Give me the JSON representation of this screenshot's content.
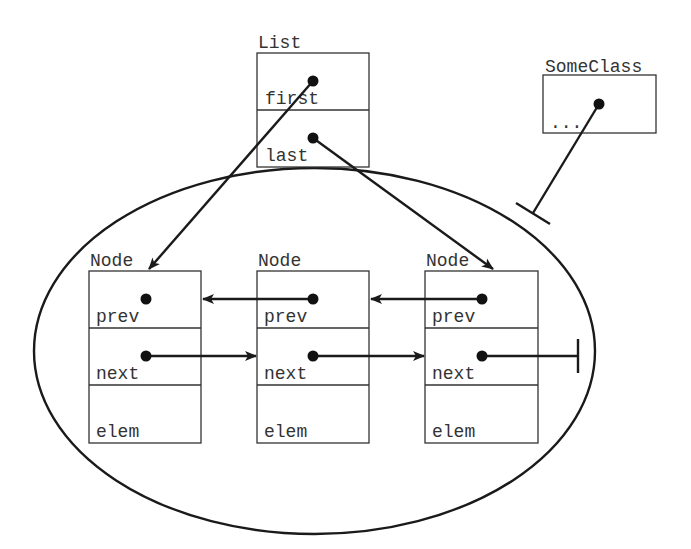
{
  "diagram": {
    "colors": {
      "stroke": "#1a1a1a",
      "text": "#333333",
      "background": "#ffffff"
    },
    "list": {
      "label": "List",
      "fields": [
        "first",
        "last"
      ]
    },
    "some_class": {
      "label": "SomeClass",
      "fields": [
        "..."
      ]
    },
    "nodes": [
      {
        "label": "Node",
        "fields": [
          "prev",
          "next",
          "elem"
        ]
      },
      {
        "label": "Node",
        "fields": [
          "prev",
          "next",
          "elem"
        ]
      },
      {
        "label": "Node",
        "fields": [
          "prev",
          "next",
          "elem"
        ]
      }
    ],
    "edges": [
      {
        "from": "List.first",
        "to": "Node[0]",
        "type": "arrow"
      },
      {
        "from": "List.last",
        "to": "Node[2]",
        "type": "arrow"
      },
      {
        "from": "Node[0].next",
        "to": "Node[1]",
        "type": "arrow"
      },
      {
        "from": "Node[1].next",
        "to": "Node[2]",
        "type": "arrow"
      },
      {
        "from": "Node[1].prev",
        "to": "Node[0]",
        "type": "arrow"
      },
      {
        "from": "Node[2].prev",
        "to": "Node[1]",
        "type": "arrow"
      },
      {
        "from": "Node[0].prev",
        "to": null,
        "type": "none"
      },
      {
        "from": "Node[2].next",
        "to": null,
        "type": "null-terminator"
      },
      {
        "from": "SomeClass.field",
        "to": "List-encapsulation-boundary",
        "type": "blocked-reference"
      }
    ],
    "encapsulation_boundary": "ellipse around nodes"
  }
}
